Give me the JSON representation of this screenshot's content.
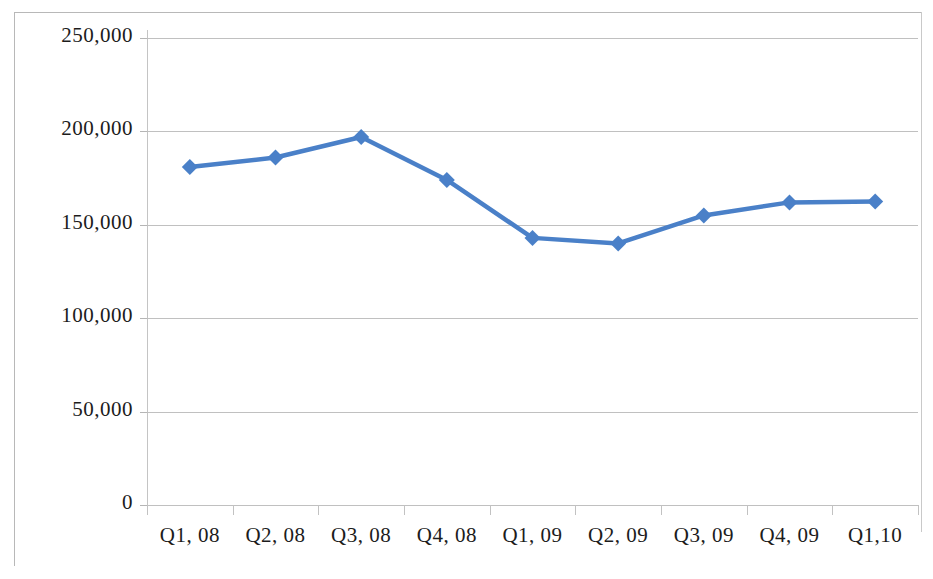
{
  "chart_data": {
    "type": "line",
    "title": "",
    "subtitle": "",
    "xlabel": "",
    "ylabel": "",
    "categories": [
      "Q1, 08",
      "Q2, 08",
      "Q3, 08",
      "Q4, 08",
      "Q1, 09",
      "Q2, 09",
      "Q3, 09",
      "Q4, 09",
      "Q1,10"
    ],
    "values": [
      181000,
      186000,
      197000,
      174000,
      143000,
      140000,
      155000,
      162000,
      162500
    ],
    "series": [
      {
        "name": "Series 1",
        "color": "#4a80c8",
        "marker": "diamond",
        "values": [
          181000,
          186000,
          197000,
          174000,
          143000,
          140000,
          155000,
          162000,
          162500
        ]
      }
    ],
    "ylim": [
      0,
      250000
    ],
    "yticks": [
      0,
      50000,
      100000,
      150000,
      200000,
      250000
    ],
    "ytick_labels": [
      "0",
      "50,000",
      "100,000",
      "150,000",
      "200,000",
      "250,000"
    ],
    "grid": true,
    "grid_axis": "y",
    "legend": false,
    "legend_position": "none",
    "plot_background": "#ffffff",
    "gridline_color": "#c0c0c0",
    "axis_color": "#c4c4c4",
    "border_color": "#b8b8b8",
    "text_color": "#1c1c1c"
  }
}
